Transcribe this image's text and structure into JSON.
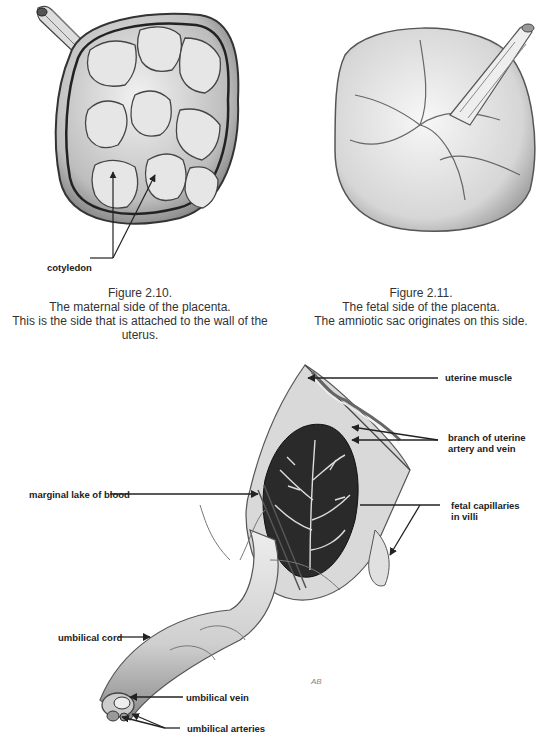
{
  "figures": [
    {
      "id": "fig-2-10",
      "number": "Figure 2.10.",
      "line1": "The maternal side of the placenta.",
      "line2": "This is the side that is attached to the wall of the uterus.",
      "labels": {
        "cotyledon": "cotyledon"
      }
    },
    {
      "id": "fig-2-11",
      "number": "Figure 2.11.",
      "line1": "The fetal side of the placenta.",
      "line2": "The amniotic sac originates on this side."
    }
  ],
  "cross_section": {
    "labels": {
      "uterine_muscle": "uterine muscle",
      "branch_line1": "branch of uterine",
      "branch_line2": "artery and vein",
      "marginal_lake": "marginal lake of blood",
      "fetal_cap_line1": "fetal capillaries",
      "fetal_cap_line2": "in villi",
      "umbilical_cord": "umbilical cord",
      "umbilical_vein": "umbilical vein",
      "umbilical_arteries": "umbilical arteries"
    },
    "signature": "AB"
  }
}
